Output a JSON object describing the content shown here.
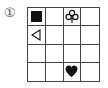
{
  "puzzle": {
    "label": "①",
    "rows": 4,
    "cols": 4,
    "line_color": "#444444",
    "symbol_color": "#111111",
    "cells": [
      [
        "filled-square",
        "",
        "club-outline",
        ""
      ],
      [
        "triangle-left-outline",
        "",
        "",
        ""
      ],
      [
        "",
        "",
        "",
        ""
      ],
      [
        "",
        "",
        "heart-filled",
        ""
      ]
    ]
  }
}
